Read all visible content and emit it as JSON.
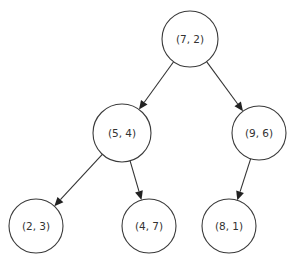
{
  "diagram": {
    "type": "kd-tree",
    "background": "#ffffff",
    "stroke_color": "#3a3a3a",
    "text_color": "#333333",
    "nodes": [
      {
        "id": "n72",
        "label": "(7, 2)",
        "cx": 190,
        "cy": 39,
        "r": 28
      },
      {
        "id": "n54",
        "label": "(5, 4)",
        "cx": 122,
        "cy": 133,
        "r": 29
      },
      {
        "id": "n96",
        "label": "(9, 6)",
        "cx": 259,
        "cy": 133,
        "r": 27
      },
      {
        "id": "n23",
        "label": "(2, 3)",
        "cx": 36,
        "cy": 226,
        "r": 27
      },
      {
        "id": "n47",
        "label": "(4, 7)",
        "cx": 149,
        "cy": 226,
        "r": 27
      },
      {
        "id": "n81",
        "label": "(8, 1)",
        "cx": 229,
        "cy": 226,
        "r": 27
      }
    ],
    "edges": [
      {
        "from": "n72",
        "to": "n54"
      },
      {
        "from": "n72",
        "to": "n96"
      },
      {
        "from": "n54",
        "to": "n23"
      },
      {
        "from": "n54",
        "to": "n47"
      },
      {
        "from": "n96",
        "to": "n81"
      }
    ]
  }
}
